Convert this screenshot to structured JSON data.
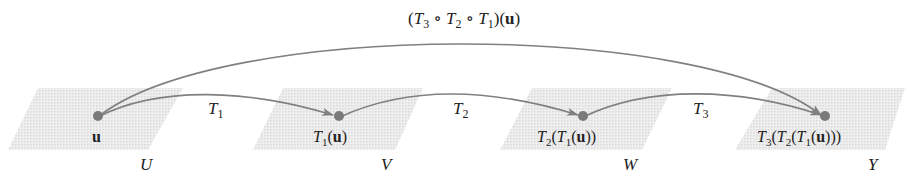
{
  "diagram": {
    "colors": {
      "plane": "#e6e6e6",
      "arrow": "#808080",
      "point": "#7a7a7a",
      "text": "#222222"
    },
    "composite_label": {
      "pre": "(",
      "T3": "T",
      "s3": "3",
      "o1": " ∘ ",
      "T2": "T",
      "s2": "2",
      "o2": " ∘ ",
      "T1": "T",
      "s1": "1",
      "post": ")(",
      "u": "u",
      "end": ")"
    },
    "spaces": [
      {
        "name": "U",
        "point_label": "u"
      },
      {
        "name": "V",
        "point_label": "T1(u)"
      },
      {
        "name": "W",
        "point_label": "T2(T1(u))"
      },
      {
        "name": "Y",
        "point_label": "T3(T2(T1(u)))"
      }
    ],
    "maps": [
      {
        "name": "T",
        "sub": "1"
      },
      {
        "name": "T",
        "sub": "2"
      },
      {
        "name": "T",
        "sub": "3"
      }
    ]
  }
}
